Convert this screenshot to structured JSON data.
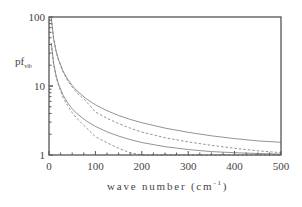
{
  "chart_data": {
    "type": "line",
    "title": "",
    "xlabel": "wave number (cm",
    "xlabel_sup": "-1",
    "xlabel_close": ")",
    "ylabel": "pf",
    "ylabel_sub": "vib",
    "xlim": [
      0,
      500
    ],
    "ylim": [
      1,
      100
    ],
    "yscale": "log",
    "grid": false,
    "legend": null,
    "x_ticks": [
      0,
      100,
      200,
      300,
      400,
      500
    ],
    "x_tick_labels": [
      "0",
      "100",
      "200",
      "300",
      "400",
      "500"
    ],
    "y_ticks": [
      1,
      10,
      100
    ],
    "y_tick_labels": [
      "1",
      "10",
      "100"
    ],
    "x": [
      5,
      10,
      15,
      20,
      30,
      40,
      50,
      60,
      80,
      100,
      125,
      150,
      175,
      200,
      250,
      300,
      350,
      400,
      450,
      500
    ],
    "series": [
      {
        "name": "upper-solid",
        "style": "solid",
        "values": [
          96.9,
          48.8,
          32.7,
          24.7,
          16.6,
          12.6,
          10.2,
          8.56,
          6.55,
          5.34,
          4.38,
          3.74,
          3.28,
          2.94,
          2.45,
          2.13,
          1.9,
          1.73,
          1.6,
          1.53
        ]
      },
      {
        "name": "upper-dashed",
        "style": "dashed",
        "values": [
          96.4,
          48.2,
          32.1,
          24.1,
          16.1,
          12.0,
          9.6,
          8.0,
          6.0,
          4.2,
          3.4,
          2.85,
          2.45,
          2.15,
          1.78,
          1.55,
          1.38,
          1.25,
          1.15,
          1.08
        ]
      },
      {
        "name": "lower-solid",
        "style": "solid",
        "values": [
          41.9,
          21.2,
          14.3,
          10.9,
          7.43,
          5.71,
          4.68,
          4.0,
          3.13,
          2.6,
          2.17,
          1.88,
          1.67,
          1.52,
          1.32,
          1.2,
          1.12,
          1.08,
          1.05,
          1.03
        ]
      },
      {
        "name": "lower-dashed",
        "style": "dashed",
        "values": [
          41.4,
          20.7,
          13.8,
          10.4,
          6.9,
          5.2,
          4.1,
          3.4,
          2.5,
          1.85,
          1.5,
          1.25,
          1.08,
          1.0,
          1.0,
          1.0,
          1.0,
          1.0,
          1.0,
          1.0
        ]
      }
    ]
  },
  "colors": {
    "frame": "#555555",
    "curve": "#777777",
    "text": "#444444"
  }
}
